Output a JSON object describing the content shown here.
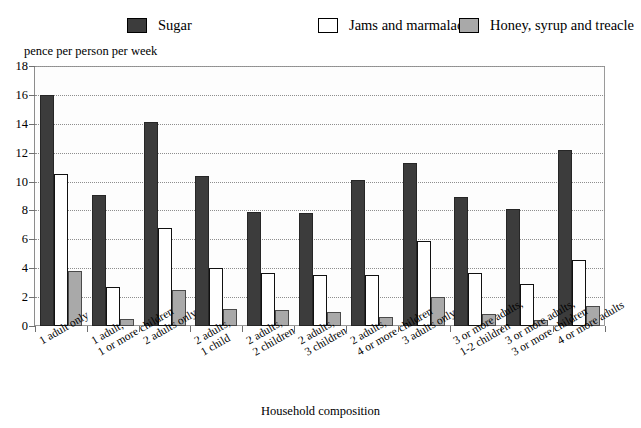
{
  "legend": {
    "items": [
      {
        "label": "Sugar",
        "swatch": "legend-swatch-sugar",
        "color": "#3c3c3c"
      },
      {
        "label": "Jams and marmalade",
        "swatch": "legend-swatch-jams",
        "color": "#ffffff"
      },
      {
        "label": "Honey, syrup and treacle",
        "swatch": "legend-swatch-honey",
        "color": "#a9a9a9"
      }
    ]
  },
  "axes": {
    "y_title": "pence per person per week",
    "x_title": "Household composition",
    "y_ticks": [
      "18",
      "16",
      "14",
      "12",
      "10",
      "8",
      "6",
      "4",
      "2",
      "0"
    ]
  },
  "chart_data": {
    "type": "bar",
    "title": "",
    "subtitle": "",
    "xlabel": "Household composition",
    "ylabel": "pence per person per week",
    "ylim": [
      0,
      18
    ],
    "ytick_step": 2,
    "grid": true,
    "legend_position": "top",
    "orientation": "vertical",
    "grouping": "grouped",
    "categories": [
      "1 adult only",
      "1 adult,\n1 or more children",
      "2 adults only",
      "2 adults,\n1 child",
      "2 adults,\n2 children",
      "2 adults,\n3 children",
      "2 adults,\n4 or more children",
      "3 adults only",
      "3 or more adults,\n1-2  children",
      "3 or more adults,\n3 or more children",
      "4 or more adults"
    ],
    "category_lines": [
      [
        "1 adult only"
      ],
      [
        "1 adult,",
        "1 or more children"
      ],
      [
        "2 adults only"
      ],
      [
        "2 adults,",
        "1 child"
      ],
      [
        "2 adults,",
        "2 children"
      ],
      [
        "2 adults,",
        "3 children"
      ],
      [
        "2 adults,",
        "4 or more children"
      ],
      [
        "3 adults only"
      ],
      [
        "3 or more adults,",
        "1-2  children"
      ],
      [
        "3 or more adults,",
        "3 or more children"
      ],
      [
        "4 or more adults"
      ]
    ],
    "series": [
      {
        "name": "Sugar",
        "color": "#3c3c3c",
        "values": [
          16.0,
          9.1,
          14.1,
          10.4,
          7.9,
          7.8,
          10.1,
          11.3,
          8.9,
          8.1,
          12.2
        ]
      },
      {
        "name": "Jams and marmalade",
        "color": "#ffffff",
        "values": [
          10.5,
          2.7,
          6.8,
          4.0,
          3.7,
          3.5,
          3.5,
          5.9,
          3.7,
          2.9,
          4.6
        ]
      },
      {
        "name": "Honey, syrup and treacle",
        "color": "#a9a9a9",
        "values": [
          3.8,
          0.5,
          2.5,
          1.2,
          1.1,
          1.0,
          0.6,
          2.0,
          0.8,
          0.4,
          1.4
        ]
      }
    ]
  }
}
